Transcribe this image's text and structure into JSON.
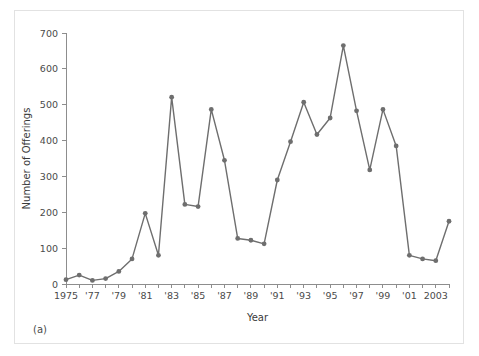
{
  "figure": {
    "caption": "(a)"
  },
  "chart_data": {
    "type": "line",
    "title": "",
    "xlabel": "Year",
    "ylabel": "Number of Offerings",
    "xlim": [
      1975,
      2004
    ],
    "ylim": [
      0,
      700
    ],
    "grid": false,
    "legend": null,
    "series_color": "#6e6e6e",
    "y_ticks": [
      0,
      100,
      200,
      300,
      400,
      500,
      600,
      700
    ],
    "y_tick_labels": [
      "0",
      "100",
      "200",
      "300",
      "400",
      "500",
      "600",
      "700"
    ],
    "x_ticks": [
      1975,
      1976,
      1977,
      1978,
      1979,
      1980,
      1981,
      1982,
      1983,
      1984,
      1985,
      1986,
      1987,
      1988,
      1989,
      1990,
      1991,
      1992,
      1993,
      1994,
      1995,
      1996,
      1997,
      1998,
      1999,
      2000,
      2001,
      2002,
      2003,
      2004
    ],
    "x_tick_labels": [
      "1975",
      "",
      "'77",
      "",
      "'79",
      "",
      "'81",
      "",
      "'83",
      "",
      "'85",
      "",
      "'87",
      "",
      "'89",
      "",
      "'91",
      "",
      "'93",
      "",
      "'95",
      "",
      "'97",
      "",
      "'99",
      "",
      "'01",
      "",
      "2003",
      ""
    ],
    "x": [
      1975,
      1976,
      1977,
      1978,
      1979,
      1980,
      1981,
      1982,
      1983,
      1984,
      1985,
      1986,
      1987,
      1988,
      1989,
      1990,
      1991,
      1992,
      1993,
      1994,
      1995,
      1996,
      1997,
      1998,
      1999,
      2000,
      2001,
      2002,
      2003,
      2004
    ],
    "values": [
      12,
      25,
      10,
      15,
      35,
      70,
      197,
      80,
      521,
      222,
      216,
      487,
      345,
      127,
      122,
      112,
      290,
      397,
      507,
      417,
      463,
      665,
      483,
      318,
      487,
      385,
      80,
      70,
      65,
      175
    ]
  }
}
